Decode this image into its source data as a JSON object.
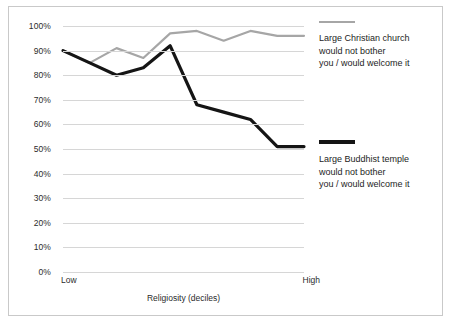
{
  "chart_data": {
    "type": "line",
    "title": "",
    "xlabel": "Religiosity (deciles)",
    "ylabel": "",
    "x": [
      1,
      2,
      3,
      4,
      5,
      6,
      7,
      8,
      9,
      10
    ],
    "x_tick_labels": [
      "Low",
      "High"
    ],
    "y_tick_labels": [
      "0%",
      "10%",
      "20%",
      "30%",
      "40%",
      "50%",
      "60%",
      "70%",
      "80%",
      "90%",
      "100%"
    ],
    "ylim": [
      0,
      100
    ],
    "grid": true,
    "legend_position": "right",
    "series": [
      {
        "name": "Large Christian church would not bother you / would welcome it",
        "color": "#a6a6a6",
        "values": [
          90,
          85,
          91,
          87,
          97,
          98,
          94,
          98,
          96,
          96
        ]
      },
      {
        "name": "Large Buddhist temple would not bother you / would welcome it",
        "color": "#151515",
        "values": [
          90,
          85,
          80,
          83,
          92,
          68,
          65,
          62,
          51,
          51
        ]
      }
    ]
  },
  "axes": {
    "y_ticks": [
      {
        "label": "100%",
        "value": 100
      },
      {
        "label": "90%",
        "value": 90
      },
      {
        "label": "80%",
        "value": 80
      },
      {
        "label": "70%",
        "value": 70
      },
      {
        "label": "60%",
        "value": 60
      },
      {
        "label": "50%",
        "value": 50
      },
      {
        "label": "40%",
        "value": 40
      },
      {
        "label": "30%",
        "value": 30
      },
      {
        "label": "20%",
        "value": 20
      },
      {
        "label": "10%",
        "value": 10
      },
      {
        "label": "0%",
        "value": 0
      }
    ],
    "x_low_label": "Low",
    "x_high_label": "High",
    "x_title": "Religiosity (deciles)"
  },
  "legend": {
    "christian": {
      "label": "Large Christian church\nwould not bother\nyou / would welcome it",
      "color": "#a6a6a6"
    },
    "buddhist": {
      "label": "Large Buddhist temple\nwould not bother\nyou / would welcome it",
      "color": "#151515"
    }
  },
  "colors": {
    "frame_border": "#c9c9c9",
    "gridline": "#d6d6d6",
    "text": "#1d1d1d",
    "background": "#ffffff"
  }
}
